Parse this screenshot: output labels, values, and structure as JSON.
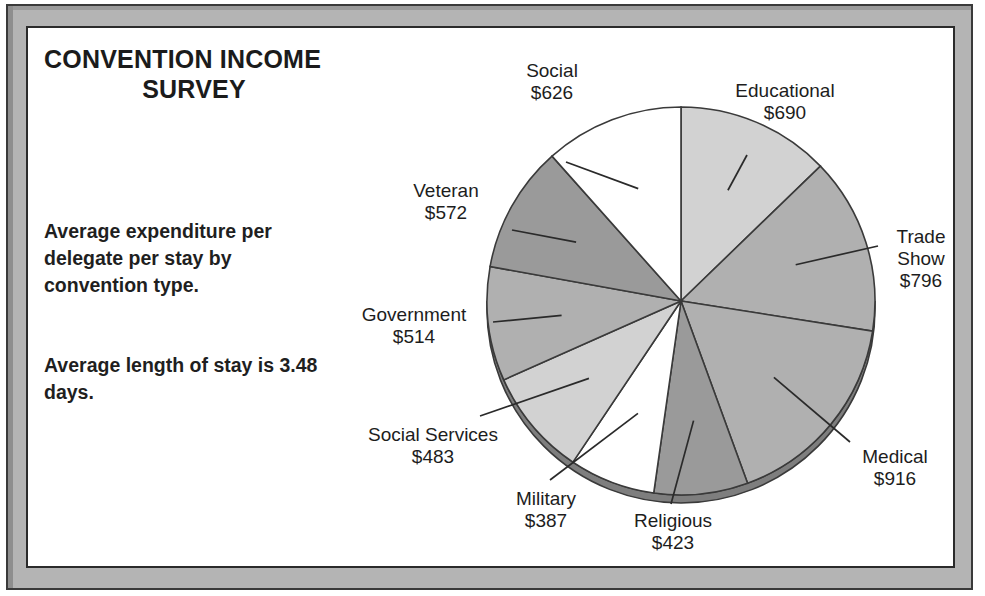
{
  "document": {
    "title_line1": "CONVENTION INCOME",
    "title_line2": "SURVEY",
    "paragraph1": "Average expenditure per delegate per stay by convention type.",
    "paragraph2": "Average length of stay is 3.48 days.",
    "currency_symbol": "$"
  },
  "labels": {
    "social": {
      "name": "Social",
      "value": "$626"
    },
    "educational": {
      "name": "Educational",
      "value": "$690"
    },
    "trade_show_l1": "Trade",
    "trade_show_l2": "Show",
    "trade_show_value": "$796",
    "medical": {
      "name": "Medical",
      "value": "$916"
    },
    "religious": {
      "name": "Religious",
      "value": "$423"
    },
    "military": {
      "name": "Military",
      "value": "$387"
    },
    "social_services": {
      "name": "Social Services",
      "value": "$483"
    },
    "government": {
      "name": "Government",
      "value": "$514"
    },
    "veteran": {
      "name": "Veteran",
      "value": "$572"
    }
  },
  "colors": {
    "frame_band": "#b4b4b4",
    "frame_line": "#2b2b2b",
    "page_bg": "#ffffff",
    "text": "#1d1d1d",
    "slice_white": "#ffffff",
    "slice_light": "#d2d2d2",
    "slice_medium": "#b0b0b0",
    "slice_dark": "#9a9a9a",
    "slice_darker": "#8d8d8d",
    "pie_edge": "#3a3a3a",
    "pie_shadow": "#7e7e7e"
  },
  "chart_data": {
    "type": "pie",
    "title": "CONVENTION INCOME SURVEY",
    "subtitle": "Average expenditure per delegate per stay by convention type.",
    "annotation": "Average length of stay is 3.48 days.",
    "unit": "USD per delegate per stay",
    "total": 5407,
    "start_angle_deg": 0,
    "direction": "clockwise",
    "legend": "none (labels with leader lines)",
    "categories": [
      "Educational",
      "Trade Show",
      "Medical",
      "Religious",
      "Military",
      "Social Services",
      "Government",
      "Veteran",
      "Social"
    ],
    "values": [
      690,
      796,
      916,
      423,
      387,
      483,
      514,
      572,
      626
    ],
    "slices": [
      {
        "label": "Educational",
        "value": 690,
        "value_text": "$690",
        "angle_deg": 45.9,
        "fill": "#d2d2d2"
      },
      {
        "label": "Trade Show",
        "value": 796,
        "value_text": "$796",
        "angle_deg": 53.0,
        "fill": "#b0b0b0"
      },
      {
        "label": "Medical",
        "value": 916,
        "value_text": "$916",
        "angle_deg": 61.0,
        "fill": "#b0b0b0"
      },
      {
        "label": "Religious",
        "value": 423,
        "value_text": "$423",
        "angle_deg": 28.2,
        "fill": "#9a9a9a"
      },
      {
        "label": "Military",
        "value": 387,
        "value_text": "$387",
        "angle_deg": 25.8,
        "fill": "#ffffff"
      },
      {
        "label": "Social Services",
        "value": 483,
        "value_text": "$483",
        "angle_deg": 32.2,
        "fill": "#d2d2d2"
      },
      {
        "label": "Government",
        "value": 514,
        "value_text": "$514",
        "angle_deg": 34.2,
        "fill": "#b0b0b0"
      },
      {
        "label": "Veteran",
        "value": 572,
        "value_text": "$572",
        "angle_deg": 38.1,
        "fill": "#9a9a9a"
      },
      {
        "label": "Social",
        "value": 626,
        "value_text": "$626",
        "angle_deg": 41.7,
        "fill": "#ffffff"
      }
    ]
  }
}
